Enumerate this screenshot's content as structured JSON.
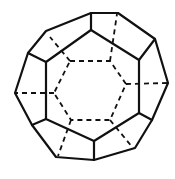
{
  "diagram": {
    "stroke_color": "#111111",
    "background": "#ffffff",
    "outer_outline": [
      [
        91,
        13
      ],
      [
        118,
        13
      ],
      [
        155,
        39
      ],
      [
        168,
        83
      ],
      [
        152,
        120
      ],
      [
        135,
        148
      ],
      [
        94,
        160
      ],
      [
        56,
        157
      ],
      [
        32,
        125
      ],
      [
        15,
        93
      ],
      [
        28,
        53
      ],
      [
        46,
        31
      ]
    ],
    "front_ring": [
      [
        91,
        30
      ],
      [
        139,
        60
      ],
      [
        139,
        113
      ],
      [
        94,
        141
      ],
      [
        46,
        119
      ],
      [
        46,
        62
      ]
    ],
    "front_spokes": [
      [
        [
          91,
          30
        ],
        [
          91,
          13
        ]
      ],
      [
        [
          139,
          60
        ],
        [
          155,
          39
        ]
      ],
      [
        [
          139,
          113
        ],
        [
          152,
          120
        ]
      ],
      [
        [
          94,
          141
        ],
        [
          94,
          160
        ]
      ],
      [
        [
          46,
          119
        ],
        [
          32,
          125
        ]
      ],
      [
        [
          46,
          62
        ],
        [
          28,
          53
        ]
      ]
    ],
    "hidden_ring": [
      [
        70,
        61
      ],
      [
        110,
        61
      ],
      [
        126,
        84
      ],
      [
        110,
        120
      ],
      [
        71,
        120
      ],
      [
        54,
        93
      ]
    ],
    "hidden_spokes": [
      [
        [
          70,
          61
        ],
        [
          50,
          37
        ]
      ],
      [
        [
          110,
          61
        ],
        [
          117,
          14
        ]
      ],
      [
        [
          126,
          84
        ],
        [
          168,
          83
        ]
      ],
      [
        [
          110,
          120
        ],
        [
          133,
          148
        ]
      ],
      [
        [
          71,
          120
        ],
        [
          58,
          156
        ]
      ],
      [
        [
          54,
          93
        ],
        [
          15,
          93
        ]
      ]
    ]
  }
}
